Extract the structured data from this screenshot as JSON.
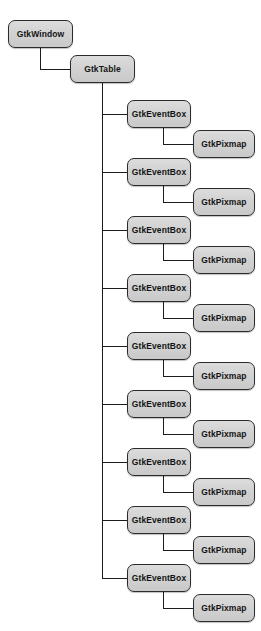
{
  "diagram": {
    "type": "tree",
    "background_color": "#ffffff",
    "node_fill_color": "#d4d4d4",
    "node_border_color": "#2b2b2b",
    "edge_color": "#1c1c1c",
    "text_color": "#141414",
    "labels": {
      "window": "GtkWindow",
      "table": "GtkTable",
      "event_box": "GtkEventBox",
      "pixmap": "GtkPixmap"
    },
    "nodes": [
      {
        "id": "window",
        "label": "GtkWindow",
        "x": 8,
        "y": 20,
        "w": 65,
        "h": 28,
        "depth": 0
      },
      {
        "id": "table",
        "label": "GtkTable",
        "x": 70,
        "y": 55,
        "w": 65,
        "h": 28,
        "depth": 1
      },
      {
        "id": "eventbox-1",
        "label": "GtkEventBox",
        "x": 127,
        "y": 100,
        "w": 64,
        "h": 28,
        "depth": 2
      },
      {
        "id": "pixmap-1",
        "label": "GtkPixmap",
        "x": 193,
        "y": 130,
        "w": 62,
        "h": 28,
        "depth": 3
      },
      {
        "id": "eventbox-2",
        "label": "GtkEventBox",
        "x": 127,
        "y": 158,
        "w": 64,
        "h": 28,
        "depth": 2
      },
      {
        "id": "pixmap-2",
        "label": "GtkPixmap",
        "x": 193,
        "y": 188,
        "w": 62,
        "h": 28,
        "depth": 3
      },
      {
        "id": "eventbox-3",
        "label": "GtkEventBox",
        "x": 127,
        "y": 216,
        "w": 64,
        "h": 28,
        "depth": 2
      },
      {
        "id": "pixmap-3",
        "label": "GtkPixmap",
        "x": 193,
        "y": 246,
        "w": 62,
        "h": 28,
        "depth": 3
      },
      {
        "id": "eventbox-4",
        "label": "GtkEventBox",
        "x": 127,
        "y": 274,
        "w": 64,
        "h": 28,
        "depth": 2
      },
      {
        "id": "pixmap-4",
        "label": "GtkPixmap",
        "x": 193,
        "y": 304,
        "w": 62,
        "h": 28,
        "depth": 3
      },
      {
        "id": "eventbox-5",
        "label": "GtkEventBox",
        "x": 127,
        "y": 332,
        "w": 64,
        "h": 28,
        "depth": 2
      },
      {
        "id": "pixmap-5",
        "label": "GtkPixmap",
        "x": 193,
        "y": 362,
        "w": 62,
        "h": 28,
        "depth": 3
      },
      {
        "id": "eventbox-6",
        "label": "GtkEventBox",
        "x": 127,
        "y": 390,
        "w": 64,
        "h": 28,
        "depth": 2
      },
      {
        "id": "pixmap-6",
        "label": "GtkPixmap",
        "x": 193,
        "y": 420,
        "w": 62,
        "h": 28,
        "depth": 3
      },
      {
        "id": "eventbox-7",
        "label": "GtkEventBox",
        "x": 127,
        "y": 448,
        "w": 64,
        "h": 28,
        "depth": 2
      },
      {
        "id": "pixmap-7",
        "label": "GtkPixmap",
        "x": 193,
        "y": 478,
        "w": 62,
        "h": 28,
        "depth": 3
      },
      {
        "id": "eventbox-8",
        "label": "GtkEventBox",
        "x": 127,
        "y": 506,
        "w": 64,
        "h": 28,
        "depth": 2
      },
      {
        "id": "pixmap-8",
        "label": "GtkPixmap",
        "x": 193,
        "y": 536,
        "w": 62,
        "h": 28,
        "depth": 3
      },
      {
        "id": "eventbox-9",
        "label": "GtkEventBox",
        "x": 127,
        "y": 564,
        "w": 64,
        "h": 28,
        "depth": 2
      },
      {
        "id": "pixmap-9",
        "label": "GtkPixmap",
        "x": 193,
        "y": 594,
        "w": 62,
        "h": 28,
        "depth": 3
      }
    ],
    "edges": [
      {
        "id": "edge-window-table",
        "from": "window",
        "to": "table",
        "segments": [
          {
            "dir": "v",
            "x": 40,
            "y": 48,
            "len": 22
          },
          {
            "dir": "h",
            "x": 40,
            "y": 69,
            "len": 30
          }
        ]
      },
      {
        "id": "edge-table-trunk",
        "from": "table",
        "to": "eventbox-bus",
        "segments": [
          {
            "dir": "v",
            "x": 102,
            "y": 83,
            "len": 495
          }
        ]
      },
      {
        "id": "edge-trunk-eventbox-1",
        "from": "table",
        "to": "eventbox-1",
        "segments": [
          {
            "dir": "h",
            "x": 102,
            "y": 114,
            "len": 25
          }
        ]
      },
      {
        "id": "edge-trunk-eventbox-2",
        "from": "table",
        "to": "eventbox-2",
        "segments": [
          {
            "dir": "h",
            "x": 102,
            "y": 172,
            "len": 25
          }
        ]
      },
      {
        "id": "edge-trunk-eventbox-3",
        "from": "table",
        "to": "eventbox-3",
        "segments": [
          {
            "dir": "h",
            "x": 102,
            "y": 230,
            "len": 25
          }
        ]
      },
      {
        "id": "edge-trunk-eventbox-4",
        "from": "table",
        "to": "eventbox-4",
        "segments": [
          {
            "dir": "h",
            "x": 102,
            "y": 288,
            "len": 25
          }
        ]
      },
      {
        "id": "edge-trunk-eventbox-5",
        "from": "table",
        "to": "eventbox-5",
        "segments": [
          {
            "dir": "h",
            "x": 102,
            "y": 346,
            "len": 25
          }
        ]
      },
      {
        "id": "edge-trunk-eventbox-6",
        "from": "table",
        "to": "eventbox-6",
        "segments": [
          {
            "dir": "h",
            "x": 102,
            "y": 404,
            "len": 25
          }
        ]
      },
      {
        "id": "edge-trunk-eventbox-7",
        "from": "table",
        "to": "eventbox-7",
        "segments": [
          {
            "dir": "h",
            "x": 102,
            "y": 462,
            "len": 25
          }
        ]
      },
      {
        "id": "edge-trunk-eventbox-8",
        "from": "table",
        "to": "eventbox-8",
        "segments": [
          {
            "dir": "h",
            "x": 102,
            "y": 520,
            "len": 25
          }
        ]
      },
      {
        "id": "edge-trunk-eventbox-9",
        "from": "table",
        "to": "eventbox-9",
        "segments": [
          {
            "dir": "h",
            "x": 102,
            "y": 578,
            "len": 25
          }
        ]
      },
      {
        "id": "edge-eventbox-1-pixmap-1",
        "from": "eventbox-1",
        "to": "pixmap-1",
        "segments": [
          {
            "dir": "v",
            "x": 163,
            "y": 128,
            "len": 16
          },
          {
            "dir": "h",
            "x": 163,
            "y": 144,
            "len": 30
          }
        ]
      },
      {
        "id": "edge-eventbox-2-pixmap-2",
        "from": "eventbox-2",
        "to": "pixmap-2",
        "segments": [
          {
            "dir": "v",
            "x": 163,
            "y": 186,
            "len": 16
          },
          {
            "dir": "h",
            "x": 163,
            "y": 202,
            "len": 30
          }
        ]
      },
      {
        "id": "edge-eventbox-3-pixmap-3",
        "from": "eventbox-3",
        "to": "pixmap-3",
        "segments": [
          {
            "dir": "v",
            "x": 163,
            "y": 244,
            "len": 16
          },
          {
            "dir": "h",
            "x": 163,
            "y": 260,
            "len": 30
          }
        ]
      },
      {
        "id": "edge-eventbox-4-pixmap-4",
        "from": "eventbox-4",
        "to": "pixmap-4",
        "segments": [
          {
            "dir": "v",
            "x": 163,
            "y": 302,
            "len": 16
          },
          {
            "dir": "h",
            "x": 163,
            "y": 318,
            "len": 30
          }
        ]
      },
      {
        "id": "edge-eventbox-5-pixmap-5",
        "from": "eventbox-5",
        "to": "pixmap-5",
        "segments": [
          {
            "dir": "v",
            "x": 163,
            "y": 360,
            "len": 16
          },
          {
            "dir": "h",
            "x": 163,
            "y": 376,
            "len": 30
          }
        ]
      },
      {
        "id": "edge-eventbox-6-pixmap-6",
        "from": "eventbox-6",
        "to": "pixmap-6",
        "segments": [
          {
            "dir": "v",
            "x": 163,
            "y": 418,
            "len": 16
          },
          {
            "dir": "h",
            "x": 163,
            "y": 434,
            "len": 30
          }
        ]
      },
      {
        "id": "edge-eventbox-7-pixmap-7",
        "from": "eventbox-7",
        "to": "pixmap-7",
        "segments": [
          {
            "dir": "v",
            "x": 163,
            "y": 476,
            "len": 16
          },
          {
            "dir": "h",
            "x": 163,
            "y": 492,
            "len": 30
          }
        ]
      },
      {
        "id": "edge-eventbox-8-pixmap-8",
        "from": "eventbox-8",
        "to": "pixmap-8",
        "segments": [
          {
            "dir": "v",
            "x": 163,
            "y": 534,
            "len": 16
          },
          {
            "dir": "h",
            "x": 163,
            "y": 550,
            "len": 30
          }
        ]
      },
      {
        "id": "edge-eventbox-9-pixmap-9",
        "from": "eventbox-9",
        "to": "pixmap-9",
        "segments": [
          {
            "dir": "v",
            "x": 163,
            "y": 592,
            "len": 16
          },
          {
            "dir": "h",
            "x": 163,
            "y": 608,
            "len": 30
          }
        ]
      }
    ]
  }
}
